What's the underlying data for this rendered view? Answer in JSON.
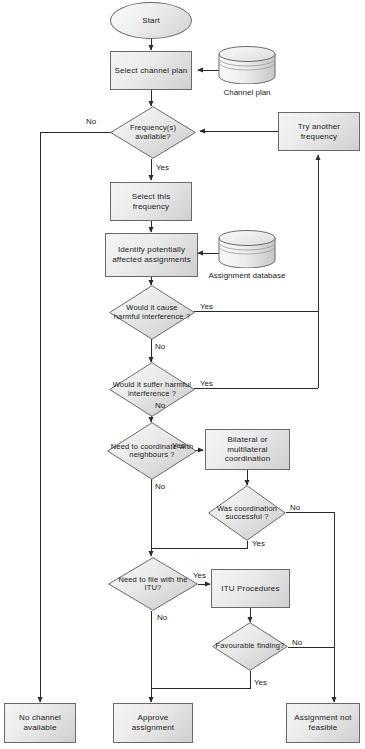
{
  "diagram": {
    "nodes": {
      "start": {
        "label": "Start",
        "type": "terminator"
      },
      "select_channel_plan": {
        "label": "Select channel plan",
        "type": "process"
      },
      "channel_plan_db": {
        "label": "Channel plan",
        "type": "database"
      },
      "freq_available": {
        "label": "Frequency(s) available?",
        "type": "decision"
      },
      "try_another_frequency": {
        "label": "Try another frequency",
        "type": "process"
      },
      "select_this_frequency": {
        "label": "Select this frequency",
        "type": "process"
      },
      "identify_affected": {
        "label": "Identify potentially affected assignments",
        "type": "process"
      },
      "assignment_db": {
        "label": "Assignment database",
        "type": "database"
      },
      "cause_harmful": {
        "label": "Would it cause harmful interference ?",
        "type": "decision"
      },
      "suffer_harmful": {
        "label": "Would it suffer harmful interference ?",
        "type": "decision"
      },
      "need_coordinate": {
        "label": "Need to coordinate with neighbours ?",
        "type": "decision"
      },
      "bilateral_coordination": {
        "label": "Bilateral or multilateral coordination",
        "type": "process"
      },
      "coordination_successful": {
        "label": "Was coordination successful ?",
        "type": "decision"
      },
      "need_file_itu": {
        "label": "Need to file with the ITU?",
        "type": "decision"
      },
      "itu_procedures": {
        "label": "ITU Procedures",
        "type": "process"
      },
      "favourable_finding": {
        "label": "Favourable finding?",
        "type": "decision"
      },
      "no_channel_available": {
        "label": "No channel available",
        "type": "process"
      },
      "approve_assignment": {
        "label": "Approve assignment",
        "type": "process"
      },
      "assignment_not_feasible": {
        "label": "Assignment not feasible",
        "type": "process"
      }
    },
    "edge_labels": {
      "freq_no": "No",
      "freq_yes": "Yes",
      "cause_yes": "Yes",
      "cause_no": "No",
      "suffer_yes": "Yes",
      "suffer_no": "No",
      "coordinate_yes": "Yes",
      "coordinate_no": "No",
      "coord_success_no": "No",
      "coord_success_yes": "Yes",
      "file_itu_yes": "Yes",
      "file_itu_no": "No",
      "favourable_no": "No",
      "favourable_yes": "Yes"
    },
    "colors": {
      "stroke": "#5a5a5a",
      "text": "#1b1b1b",
      "fill_light": "#f4f4f4",
      "fill_dark": "#cfcfcf",
      "background": "#ffffff"
    }
  }
}
